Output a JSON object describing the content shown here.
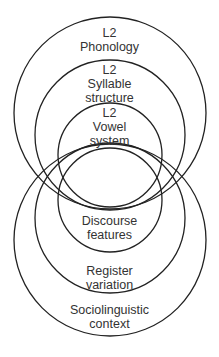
{
  "diagram": {
    "type": "overlapping nested circles",
    "stroke_color": "#222222",
    "top_set": [
      {
        "label_line1": "L2",
        "label_line2": "Phonology",
        "label_line3": ""
      },
      {
        "label_line1": "L2",
        "label_line2": "Syllable",
        "label_line3": "structure"
      },
      {
        "label_line1": "L2",
        "label_line2": "Vowel",
        "label_line3": "system"
      }
    ],
    "bottom_set": [
      {
        "label_line1": "Discourse",
        "label_line2": "features"
      },
      {
        "label_line1": "Register",
        "label_line2": "variation"
      },
      {
        "label_line1": "Sociolinguistic",
        "label_line2": "context"
      }
    ]
  }
}
